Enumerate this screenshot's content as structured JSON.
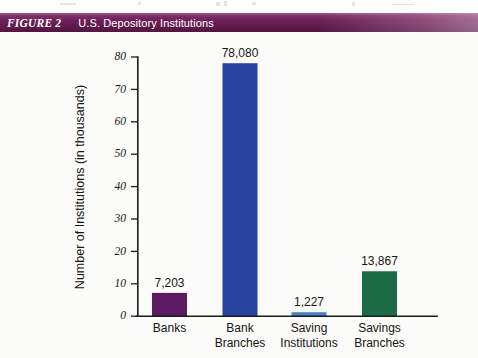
{
  "figure": {
    "label": "FIGURE 2",
    "title": "U.S. Depository Institutions"
  },
  "colors": {
    "header_band": "#6e2158",
    "page_background": "#fbfbfa",
    "axis": "#1b1b1b",
    "banks": "#5b1a62",
    "bank_branches": "#28439b",
    "saving_institutions": "#4a7fc1",
    "savings_branches": "#1b6b45"
  },
  "chart_data": {
    "type": "bar",
    "title": "U.S. Depository Institutions",
    "xlabel": "",
    "ylabel": "Number of Institutions (in thousands)",
    "ylim": [
      0,
      80
    ],
    "ytick_labels": [
      "0",
      "10",
      "20",
      "30",
      "40",
      "50",
      "60",
      "70",
      "80"
    ],
    "ytick_values": [
      0,
      10,
      20,
      30,
      40,
      50,
      60,
      70,
      80
    ],
    "grid": false,
    "legend": "none",
    "categories": [
      "Banks",
      "Bank Branches",
      "Saving Institutions",
      "Savings Branches"
    ],
    "category_lines": [
      [
        "Banks"
      ],
      [
        "Bank",
        "Branches"
      ],
      [
        "Saving",
        "Institutions"
      ],
      [
        "Savings",
        "Branches"
      ]
    ],
    "values": [
      7.203,
      78.08,
      1.227,
      13.867
    ],
    "data_labels": [
      "7,203",
      "78,080",
      "1,227",
      "13,867"
    ],
    "bar_colors": [
      "#5b1a62",
      "#28439b",
      "#4a7fc1",
      "#1b6b45"
    ]
  }
}
